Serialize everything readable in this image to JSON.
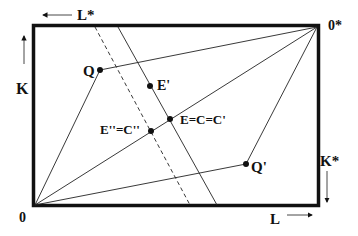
{
  "diagram": {
    "type": "Edgeworth box (factor allocation)",
    "origins": {
      "home": "0",
      "foreign": "0*"
    },
    "axes": {
      "labor_home": "L",
      "labor_foreign": "L*",
      "capital_home": "K",
      "capital_foreign": "K*"
    },
    "points": {
      "Q": "Q",
      "Q_prime": "Q'",
      "E_prime": "E'",
      "E_main": "E=C=C'",
      "E_double_prime": "E''=C''"
    },
    "line_styles": {
      "box_border": "solid-thick",
      "rays": "solid-thin",
      "solid_factor_price_line": "solid",
      "dashed_factor_price_line": "dashed"
    },
    "colors": {
      "ink": "#111111",
      "background": "#ffffff"
    }
  }
}
